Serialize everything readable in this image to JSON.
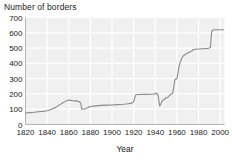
{
  "chart_data": {
    "type": "line",
    "title": "Number of borders",
    "xlabel": "Year",
    "ylabel": "",
    "xlim": [
      1820,
      2004
    ],
    "ylim": [
      0,
      700
    ],
    "grid": true,
    "legend": false,
    "legend_position": "none",
    "line_color": "#8a8a8a",
    "plot_background": "#f0f0f0",
    "gridline_color": "#ffffff",
    "xticks": [
      1820,
      1840,
      1860,
      1880,
      1900,
      1920,
      1940,
      1960,
      1980,
      2000
    ],
    "xtick_labels": [
      "1820",
      "1840",
      "1860",
      "1880",
      "1900",
      "1920",
      "1940",
      "1960",
      "1980",
      "2000"
    ],
    "yticks": [
      0,
      100,
      200,
      300,
      400,
      500,
      600,
      700
    ],
    "ytick_labels": [
      "0",
      "100",
      "200",
      "300",
      "400",
      "500",
      "600",
      "700"
    ],
    "series": [
      {
        "name": "Number of borders",
        "x": [
          1820,
          1824,
          1828,
          1832,
          1836,
          1840,
          1844,
          1848,
          1850,
          1852,
          1854,
          1856,
          1858,
          1860,
          1862,
          1864,
          1866,
          1867,
          1868,
          1870,
          1871,
          1872,
          1874,
          1876,
          1878,
          1880,
          1885,
          1890,
          1895,
          1900,
          1905,
          1910,
          1913,
          1915,
          1917,
          1918,
          1919,
          1920,
          1922,
          1925,
          1930,
          1935,
          1938,
          1939,
          1940,
          1941,
          1942,
          1943,
          1944,
          1945,
          1946,
          1947,
          1948,
          1950,
          1952,
          1954,
          1956,
          1957,
          1958,
          1959,
          1960,
          1961,
          1962,
          1963,
          1964,
          1965,
          1966,
          1968,
          1970,
          1972,
          1974,
          1975,
          1977,
          1980,
          1984,
          1988,
          1990,
          1991,
          1992,
          1993,
          1995,
          1998,
          2000,
          2003
        ],
        "values": [
          75,
          78,
          80,
          83,
          86,
          90,
          100,
          112,
          122,
          130,
          140,
          148,
          155,
          160,
          158,
          155,
          152,
          158,
          152,
          148,
          140,
          102,
          100,
          105,
          112,
          118,
          122,
          125,
          127,
          128,
          130,
          132,
          134,
          136,
          138,
          140,
          142,
          150,
          195,
          196,
          197,
          198,
          199,
          200,
          202,
          205,
          200,
          175,
          122,
          130,
          150,
          158,
          162,
          175,
          180,
          195,
          205,
          240,
          290,
          298,
          300,
          340,
          380,
          405,
          425,
          440,
          450,
          460,
          468,
          475,
          482,
          490,
          492,
          494,
          496,
          498,
          500,
          505,
          600,
          618,
          620,
          620,
          620,
          620
        ]
      }
    ]
  }
}
